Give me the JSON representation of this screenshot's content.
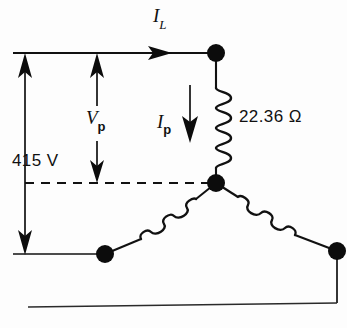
{
  "figure": {
    "type": "electrical-circuit-diagram",
    "background_color": "#fdfdfd",
    "ink_color": "#111111"
  },
  "labels": {
    "line_current": {
      "symbol": "I",
      "subscript": "L",
      "text": "I_L"
    },
    "phase_current": {
      "symbol": "I",
      "subscript": "p",
      "text": "I_p"
    },
    "phase_voltage": {
      "symbol": "V",
      "subscript": "p",
      "text": "V_p"
    },
    "line_voltage": {
      "text": "415 V",
      "value": "415",
      "unit": "V"
    },
    "impedance": {
      "text": "22.36 Ω",
      "value": "22.36",
      "unit": "Ω"
    }
  },
  "components": {
    "coils": [
      {
        "name": "coil-phase-a",
        "orientation": "vertical",
        "turns": 4,
        "label": "22.36 Ω"
      },
      {
        "name": "coil-phase-b",
        "orientation": "diagonal-down-left",
        "turns": 4
      },
      {
        "name": "coil-phase-c",
        "orientation": "diagonal-down-right",
        "turns": 4
      }
    ],
    "nodes": [
      {
        "name": "node-line-top",
        "x": 216,
        "y": 53
      },
      {
        "name": "node-star-point",
        "x": 216,
        "y": 183
      },
      {
        "name": "node-line-bottom-left",
        "x": 105,
        "y": 254
      },
      {
        "name": "node-line-bottom-right",
        "x": 337,
        "y": 251
      }
    ]
  },
  "annotations": {
    "dimension_415v": {
      "name": "dimension-line-415v",
      "from_y": 53,
      "to_y": 255,
      "x": 25
    },
    "dimension_vp": {
      "name": "dimension-line-vp",
      "from_y": 53,
      "to_y": 183,
      "x": 97
    },
    "arrow_il": {
      "name": "arrow-line-current",
      "direction": "right",
      "y": 53
    },
    "arrow_ip": {
      "name": "arrow-phase-current",
      "direction": "down",
      "x": 190
    },
    "neutral_reference": {
      "name": "dashed-neutral-line",
      "y": 183,
      "style": "dashed"
    }
  }
}
